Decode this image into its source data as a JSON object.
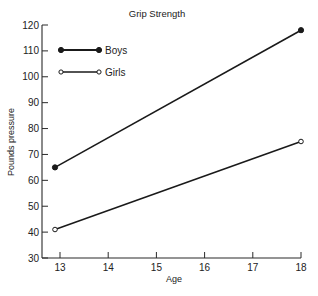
{
  "chart_data": {
    "type": "line",
    "title": "Grip Strength",
    "xlabel": "Age",
    "ylabel": "Pounds pressure",
    "x": [
      13,
      18
    ],
    "xticks": [
      13,
      14,
      15,
      16,
      17,
      18
    ],
    "yticks": [
      30,
      40,
      50,
      60,
      70,
      80,
      90,
      100,
      110,
      120
    ],
    "xlim": [
      12.6,
      18
    ],
    "ylim": [
      30,
      120
    ],
    "grid": false,
    "legend_position": "upper-left",
    "series": [
      {
        "name": "Boys",
        "values": [
          65,
          118
        ],
        "marker": "filled-circle",
        "color": "#1a1a1a"
      },
      {
        "name": "Girls",
        "values": [
          41,
          75
        ],
        "marker": "open-circle",
        "color": "#1a1a1a"
      }
    ]
  }
}
